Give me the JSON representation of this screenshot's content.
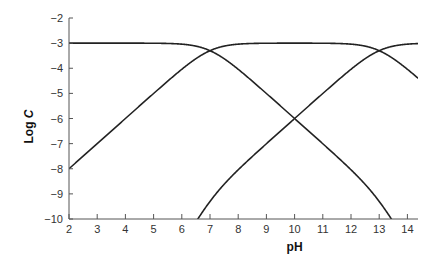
{
  "chart_data": {
    "type": "line",
    "title": "",
    "xlabel": "pH",
    "ylabel_prefix": "Log ",
    "ylabel_italic": "C",
    "xlim": [
      2,
      14.4
    ],
    "ylim": [
      -10,
      -2
    ],
    "xticks": [
      2,
      3,
      4,
      5,
      6,
      7,
      8,
      9,
      10,
      11,
      12,
      13,
      14
    ],
    "yticks": [
      -2,
      -3,
      -4,
      -5,
      -6,
      -7,
      -8,
      -9,
      -10
    ],
    "ytick_labels": [
      "−2",
      "−3",
      "−4",
      "−5",
      "−6",
      "−7",
      "−8",
      "−9",
      "−10"
    ],
    "grid": false,
    "legend": "none",
    "model": {
      "log_total_concentration": -3,
      "pKa1": 7,
      "pKa2": 13
    },
    "series": [
      {
        "name": "H2A",
        "x": [
          2,
          4,
          6,
          6.7,
          7,
          7.5,
          8,
          9,
          10,
          11,
          12,
          13,
          13.4
        ],
        "values": [
          -3,
          -3,
          -3.04,
          -3.15,
          -3.3,
          -3.62,
          -4.04,
          -5.0,
          -6.0,
          -7.0,
          -8.0,
          -9.3,
          -10.0
        ]
      },
      {
        "name": "HA-",
        "x": [
          2,
          4,
          6,
          7,
          8,
          10,
          12,
          13,
          14,
          14.4
        ],
        "values": [
          -8.0,
          -6.0,
          -4.04,
          -3.3,
          -3.04,
          -3.0,
          -3.04,
          -3.3,
          -4.04,
          -4.4
        ]
      },
      {
        "name": "A2-",
        "x": [
          6.5,
          7,
          8,
          9,
          10,
          11,
          12,
          13,
          14,
          14.4
        ],
        "values": [
          -10.0,
          -9.3,
          -8.0,
          -7.0,
          -6.0,
          -5.0,
          -4.04,
          -3.3,
          -3.04,
          -3.02
        ]
      }
    ]
  }
}
